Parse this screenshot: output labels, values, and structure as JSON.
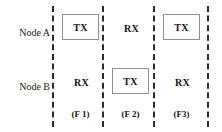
{
  "diagram": {
    "rows": [
      {
        "id": "node-a",
        "label": "Node A"
      },
      {
        "id": "node-b",
        "label": "Node B"
      }
    ],
    "columns": [
      {
        "id": "slot-1",
        "caption": "(F 1)",
        "node_a": {
          "text": "TX",
          "boxed": true
        },
        "node_b": {
          "text": "RX",
          "boxed": false
        }
      },
      {
        "id": "slot-2",
        "caption": "(F 2)",
        "node_a": {
          "text": "RX",
          "boxed": false
        },
        "node_b": {
          "text": "TX",
          "boxed": true
        }
      },
      {
        "id": "slot-3",
        "caption": "(F3)",
        "node_a": {
          "text": "TX",
          "boxed": true
        },
        "node_b": {
          "text": "RX",
          "boxed": false
        }
      }
    ],
    "dividers": [
      52,
      102,
      153,
      207
    ],
    "colors": {
      "background": "#ffffff",
      "text": "#111111",
      "divider": "#2b2b2b",
      "box_border": "#8e8e8e"
    }
  }
}
